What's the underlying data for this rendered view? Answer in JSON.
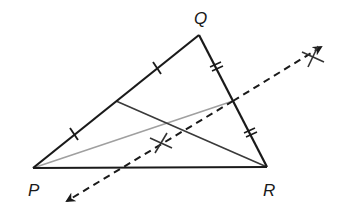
{
  "diagram": {
    "type": "triangle-construction",
    "vertices": {
      "P": {
        "label": "P",
        "x": 33,
        "y": 168
      },
      "Q": {
        "label": "Q",
        "x": 199,
        "y": 35
      },
      "R": {
        "label": "R",
        "x": 267,
        "y": 167
      }
    },
    "labels": {
      "P": "P",
      "Q": "Q",
      "R": "R"
    },
    "midpoints": {
      "PQ": {
        "x": 116,
        "y": 101
      },
      "QR": {
        "x": 233,
        "y": 101
      }
    },
    "segments": [
      {
        "name": "side-PQ",
        "from": "P",
        "to": "Q",
        "style": "solid",
        "color": "#1a1a1a"
      },
      {
        "name": "side-QR",
        "from": "Q",
        "to": "R",
        "style": "solid",
        "color": "#1a1a1a"
      },
      {
        "name": "side-PR",
        "from": "P",
        "to": "R",
        "style": "solid",
        "color": "#1a1a1a"
      },
      {
        "name": "median-from-R",
        "from": "midpoint-PQ",
        "to": "R",
        "style": "solid",
        "color": "#3a3a3a"
      },
      {
        "name": "median-from-P",
        "from": "P",
        "to": "midpoint-QR",
        "style": "solid",
        "color": "#a0a0a0"
      }
    ],
    "perpendicular_bisector": {
      "of": "QR",
      "style": "dashed",
      "arrows": "both",
      "start": {
        "x": 65,
        "y": 202
      },
      "end": {
        "x": 323,
        "y": 46
      },
      "color": "#1a1a1a"
    },
    "arc_marks": [
      {
        "name": "arc-intersection-lower",
        "x": 161,
        "y": 143
      },
      {
        "name": "arc-intersection-upper",
        "x": 313,
        "y": 56
      }
    ],
    "tick_marks": {
      "PQ": {
        "count": 1,
        "positions": [
          {
            "x": 74,
            "y": 134
          },
          {
            "x": 157,
            "y": 68
          }
        ]
      },
      "QR": {
        "count": 2,
        "positions": [
          {
            "x": 216,
            "y": 68
          },
          {
            "x": 250,
            "y": 134
          }
        ]
      }
    },
    "colors": {
      "stroke": "#1a1a1a",
      "median_dark": "#3a3a3a",
      "median_light": "#a0a0a0",
      "background": "#ffffff"
    }
  }
}
